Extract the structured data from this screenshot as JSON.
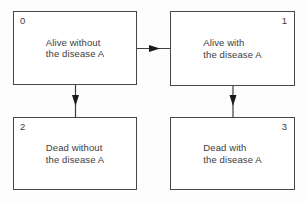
{
  "diagram": {
    "type": "state-transition-diagram",
    "boxes": [
      {
        "id": "0",
        "line1": "Alive without",
        "line2": "the disease A",
        "number_corner": "top-left"
      },
      {
        "id": "1",
        "line1": "Alive with",
        "line2": "the disease A",
        "number_corner": "top-right"
      },
      {
        "id": "2",
        "line1": "Dead without",
        "line2": "the disease A",
        "number_corner": "top-left"
      },
      {
        "id": "3",
        "line1": "Dead with",
        "line2": "the disease A",
        "number_corner": "top-right"
      }
    ],
    "transitions": [
      {
        "from": "0",
        "to": "1",
        "direction": "right"
      },
      {
        "from": "0",
        "to": "2",
        "direction": "down"
      },
      {
        "from": "1",
        "to": "3",
        "direction": "down"
      }
    ],
    "colors": {
      "background": "#fdfdfd",
      "box_fill": "#ffffff",
      "border": "#474747",
      "text": "#3c3c3c",
      "arrow": "#1a1a1a"
    }
  }
}
